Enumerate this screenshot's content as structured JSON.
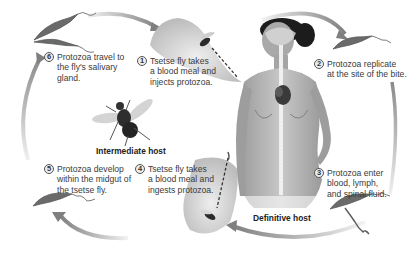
{
  "diagram": {
    "title": "",
    "colors": {
      "arrow": "#8a8a8a",
      "protozoa": "#6a6a6a",
      "fly": "#3a3a3a",
      "skin": "#b9b9b9",
      "hair": "#1c1c1c",
      "bubble": "#d6d6d6",
      "text": "#3a3a3a"
    },
    "steps": [
      {
        "number": "1",
        "text": "Tsetse fly takes\na blood meal and\ninjects protozoa."
      },
      {
        "number": "2",
        "text": "Protozoa replicate\nat the site of the bite."
      },
      {
        "number": "3",
        "text": "Protozoa enter\nblood, lymph,\nand spinal fluid."
      },
      {
        "number": "4",
        "text": "Tsetse fly takes\na blood meal and\ningests protozoa."
      },
      {
        "number": "5",
        "text": "Protozoa develop\nwithin the midgut of\nthe tsetse fly."
      },
      {
        "number": "6",
        "text": "Protozoa travel to\nthe fly's salivary\ngland."
      }
    ],
    "labels": {
      "intermediate_host": "Intermediate host",
      "definitive_host": "Definitive host"
    },
    "icons": [
      "tsetse-fly-icon",
      "human-figure-icon",
      "trypanosome-icon",
      "cycle-arrow-icon"
    ]
  }
}
